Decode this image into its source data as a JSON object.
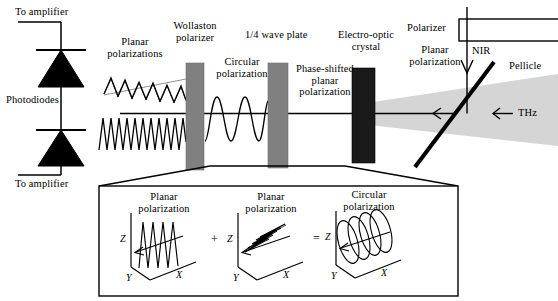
{
  "figure": {
    "type": "optical-schematic"
  },
  "colors": {
    "stroke": "#000000",
    "background": "#ffffff",
    "component_gray": "#808080",
    "component_black": "#1a1a1a",
    "thz_beam": "#d5d5d5"
  },
  "labels": {
    "to_amplifier_top": "To amplifier",
    "to_amplifier_bottom": "To amplifier",
    "photodiodes": "Photodiodes",
    "planar_polarizations": "Planar\npolarizations",
    "wollaston_polarizer": "Wollaston\npolarizer",
    "circular_polarization": "Circular\npolarization",
    "quarter_wave_plate": "1/4 wave plate",
    "phase_shifted": "Phase-shifted\nplanar\npolarization",
    "electro_optic_crystal": "Electro-optic\ncrystal",
    "polarizer": "Polarizer",
    "planar_polarization_nir": "Planar\npolarization",
    "nir": "NIR",
    "pellicle": "Pellicle",
    "thz": "THz"
  },
  "inset": {
    "panels": [
      {
        "title": "Planar\npolarization",
        "wave": "vertical-planar",
        "axes": {
          "z": "Z",
          "y": "Y",
          "x": "X"
        }
      },
      {
        "title": "Planar\npolarization",
        "wave": "horizontal-planar",
        "axes": {
          "z": "Z",
          "y": "Y",
          "x": "X"
        }
      },
      {
        "title": "Circular\npolarization",
        "wave": "helix",
        "axes": {
          "z": "Z",
          "y": "Y",
          "x": "X"
        }
      }
    ],
    "operators": {
      "plus": "+",
      "equals": "="
    }
  }
}
